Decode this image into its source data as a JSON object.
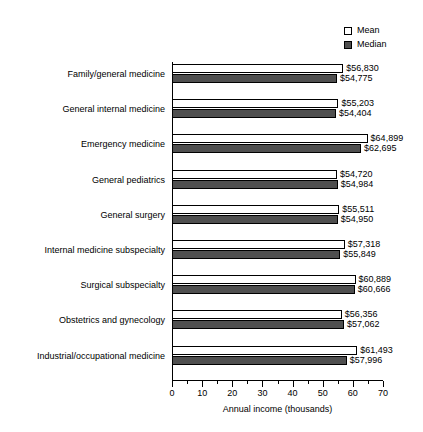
{
  "legend": {
    "position": "top-right",
    "entries": [
      {
        "label": "Mean",
        "swatch": "mean",
        "color": "#ffffff"
      },
      {
        "label": "Median",
        "swatch": "median",
        "color": "#4f4f4f"
      }
    ]
  },
  "axis": {
    "title": "Annual income (thousands)",
    "ticks": [
      "0",
      "10",
      "20",
      "30",
      "40",
      "50",
      "60",
      "70"
    ]
  },
  "chart_data": {
    "type": "bar",
    "orientation": "horizontal",
    "title": "",
    "xlabel": "Annual income (thousands)",
    "ylabel": "",
    "xlim": [
      0,
      70
    ],
    "xticks": [
      0,
      10,
      20,
      30,
      40,
      50,
      60,
      70
    ],
    "minor_tick_step": 5,
    "grid": false,
    "legend_position": "top-right",
    "value_unit": "dollars",
    "categories": [
      "Family/general medicine",
      "General internal medicine",
      "Emergency medicine",
      "General pediatrics",
      "General surgery",
      "Internal medicine subspecialty",
      "Surgical subspecialty",
      "Obstetrics and gynecology",
      "Industrial/occupational medicine"
    ],
    "series": [
      {
        "name": "Mean",
        "color": "#ffffff",
        "values": [
          56830,
          55203,
          64899,
          54720,
          55511,
          57318,
          60889,
          56356,
          61493
        ],
        "labels": [
          "$56,830",
          "$55,203",
          "$64,899",
          "$54,720",
          "$55,511",
          "$57,318",
          "$60,889",
          "$56,356",
          "$61,493"
        ]
      },
      {
        "name": "Median",
        "color": "#4f4f4f",
        "values": [
          54775,
          54404,
          62695,
          54984,
          54950,
          55849,
          60666,
          57062,
          57996
        ],
        "labels": [
          "$54,775",
          "$54,404",
          "$62,695",
          "$54,984",
          "$54,950",
          "$55,849",
          "$60,666",
          "$57,062",
          "$57,996"
        ]
      }
    ]
  }
}
